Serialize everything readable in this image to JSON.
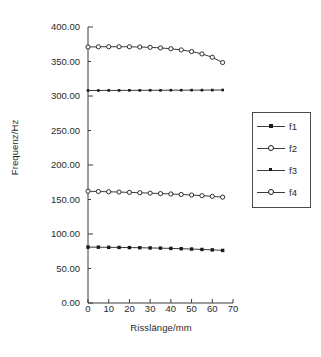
{
  "chart_data": {
    "type": "line",
    "title": "",
    "xlabel": "Risslänge/mm",
    "ylabel": "Frequenz/Hz",
    "xlim": [
      0,
      70
    ],
    "ylim": [
      0,
      400
    ],
    "xticks": [
      "0",
      "10",
      "20",
      "30",
      "40",
      "50",
      "60",
      "70"
    ],
    "xtick_values": [
      0,
      10,
      20,
      30,
      40,
      50,
      60,
      70
    ],
    "yticks": [
      "0.00",
      "50.00",
      "100.00",
      "150.00",
      "200.00",
      "250.00",
      "300.00",
      "350.00",
      "400.00"
    ],
    "ytick_values": [
      0,
      50,
      100,
      150,
      200,
      250,
      300,
      350,
      400
    ],
    "grid": false,
    "legend_position": "right",
    "x": [
      0,
      5,
      10,
      15,
      20,
      25,
      30,
      35,
      40,
      45,
      50,
      55,
      60,
      65
    ],
    "series": [
      {
        "name": "f1",
        "marker": "filled-square",
        "values": [
          81.0,
          80.9,
          80.7,
          80.5,
          80.3,
          80.1,
          79.8,
          79.5,
          79.1,
          78.7,
          78.2,
          77.6,
          77.0,
          76.2
        ]
      },
      {
        "name": "f2",
        "marker": "open-circle",
        "values": [
          162.0,
          161.6,
          161.2,
          160.8,
          160.3,
          159.8,
          159.2,
          158.6,
          158.0,
          157.3,
          156.5,
          155.6,
          154.6,
          153.4
        ]
      },
      {
        "name": "f3",
        "marker": "dot",
        "values": [
          308.0,
          308.0,
          308.1,
          308.1,
          308.2,
          308.2,
          308.3,
          308.3,
          308.4,
          308.4,
          308.5,
          308.5,
          308.6,
          308.7
        ]
      },
      {
        "name": "f4",
        "marker": "open-circle",
        "values": [
          371.0,
          371.3,
          371.4,
          371.4,
          371.3,
          371.0,
          370.5,
          369.7,
          368.5,
          366.8,
          364.4,
          361.0,
          356.2,
          348.5
        ]
      }
    ]
  },
  "legend": {
    "entries": [
      {
        "label": "f1"
      },
      {
        "label": "f2"
      },
      {
        "label": "f3"
      },
      {
        "label": "f4"
      }
    ]
  },
  "colors": {
    "ink": "#1a1a1a",
    "axis": "#3a3a3a",
    "background": "#ffffff"
  }
}
